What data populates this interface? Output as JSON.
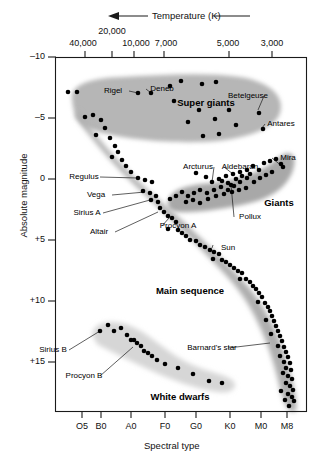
{
  "figure": {
    "kind": "hertzsprung-russell-diagram",
    "top_axis_title": "Temperature (K)",
    "top_axis_arrow": "←",
    "bottom_axis_title": "Spectral type",
    "left_axis_title": "Absolute magnitude"
  },
  "axes": {
    "top_ticks": [
      {
        "label": "40,000",
        "x": 85,
        "label_x": 83,
        "raised": false
      },
      {
        "label": "20,000",
        "x": 112,
        "label_x": 112,
        "raised": true
      },
      {
        "label": "10,000",
        "x": 134,
        "label_x": 136,
        "raised": false
      },
      {
        "label": "7,000",
        "x": 164,
        "label_x": 166,
        "raised": false
      },
      {
        "label": "5,000",
        "x": 229,
        "label_x": 228,
        "raised": false
      },
      {
        "label": "3,000",
        "x": 272,
        "label_x": 272,
        "raised": false
      }
    ],
    "bottom_ticks": [
      {
        "label": "O5",
        "x": 82
      },
      {
        "label": "B0",
        "x": 101
      },
      {
        "label": "A0",
        "x": 131
      },
      {
        "label": "F0",
        "x": 165
      },
      {
        "label": "G0",
        "x": 196
      },
      {
        "label": "K0",
        "x": 230
      },
      {
        "label": "M0",
        "x": 261
      },
      {
        "label": "M8",
        "x": 287
      }
    ],
    "left_ticks": [
      {
        "label": "–10",
        "y": 57
      },
      {
        "label": "–5",
        "y": 118
      },
      {
        "label": "0",
        "y": 179
      },
      {
        "label": "+5",
        "y": 240
      },
      {
        "label": "+10",
        "y": 301
      },
      {
        "label": "+15",
        "y": 362
      }
    ]
  },
  "chart_data": {
    "type": "scatter",
    "xlabel": "Spectral type",
    "ylabel": "Absolute magnitude",
    "secondary_xlabel": "Temperature (K)",
    "xticklabels": [
      "O5",
      "B0",
      "A0",
      "F0",
      "G0",
      "K0",
      "M0",
      "M8"
    ],
    "secondary_xticklabels": [
      "40,000",
      "20,000",
      "10,000",
      "7,000",
      "5,000",
      "3,000"
    ],
    "yticklabels": [
      "–10",
      "–5",
      "0",
      "+5",
      "+10",
      "+15"
    ],
    "ylim": [
      -10,
      17.5
    ],
    "y_inverted": true,
    "grid": false,
    "legend": "none",
    "regions": [
      {
        "name": "Super giants",
        "label_x": 206,
        "label_y": 97,
        "fill": "#b9b9b9"
      },
      {
        "name": "Giants",
        "label_x": 279,
        "label_y": 197,
        "fill": "#ababab"
      },
      {
        "name": "Main sequence",
        "label_x": 190,
        "label_y": 285,
        "fill": "#b0b0b0"
      },
      {
        "name": "White dwarfs",
        "label_x": 180,
        "label_y": 391,
        "fill": "#d8d8d8"
      }
    ],
    "annotations": [
      {
        "name": "Rigel",
        "label_x": 113,
        "label_y": 86,
        "point_x": 138,
        "point_y": 93
      },
      {
        "name": "Deneb",
        "label_x": 162,
        "label_y": 84,
        "point_x": 151,
        "point_y": 93
      },
      {
        "name": "Betelgeuse",
        "label_x": 248,
        "label_y": 91,
        "point_x": 258,
        "point_y": 110
      },
      {
        "name": "Antares",
        "label_x": 281,
        "label_y": 119,
        "point_x": 262,
        "point_y": 128
      },
      {
        "name": "Mira",
        "label_x": 288,
        "label_y": 153,
        "point_x": 283,
        "point_y": 167
      },
      {
        "name": "Arcturus",
        "label_x": 198,
        "label_y": 162,
        "point_x": 212,
        "point_y": 182
      },
      {
        "name": "Aldebaran",
        "label_x": 240,
        "label_y": 162,
        "point_x": 233,
        "point_y": 174
      },
      {
        "name": "Pollux",
        "label_x": 250,
        "label_y": 212,
        "point_x": 231,
        "point_y": 185
      },
      {
        "name": "Regulus",
        "label_x": 84,
        "label_y": 172,
        "point_x": 138,
        "point_y": 178
      },
      {
        "name": "Vega",
        "label_x": 96,
        "label_y": 190,
        "point_x": 145,
        "point_y": 192
      },
      {
        "name": "Sirius A",
        "label_x": 87,
        "label_y": 208,
        "point_x": 150,
        "point_y": 200
      },
      {
        "name": "Altair",
        "label_x": 99,
        "label_y": 227,
        "point_x": 158,
        "point_y": 212
      },
      {
        "name": "Procyon A",
        "label_x": 178,
        "label_y": 221,
        "point_x": 169,
        "point_y": 218
      },
      {
        "name": "Sun",
        "label_x": 228,
        "label_y": 243,
        "point_x": 213,
        "point_y": 245
      },
      {
        "name": "Barnard's star",
        "label_x": 212,
        "label_y": 343,
        "point_x": 270,
        "point_y": 343
      },
      {
        "name": "Sirius B",
        "label_x": 53,
        "label_y": 345,
        "point_x": 100,
        "point_y": 331
      },
      {
        "name": "Procyon B",
        "label_x": 84,
        "label_y": 371,
        "point_x": 133,
        "point_y": 347
      }
    ],
    "points": [
      [
        68,
        92
      ],
      [
        77,
        92
      ],
      [
        138,
        93
      ],
      [
        151,
        93
      ],
      [
        181,
        81
      ],
      [
        202,
        84
      ],
      [
        216,
        82
      ],
      [
        174,
        101
      ],
      [
        199,
        110
      ],
      [
        229,
        110
      ],
      [
        259,
        113
      ],
      [
        188,
        122
      ],
      [
        215,
        119
      ],
      [
        236,
        125
      ],
      [
        263,
        129
      ],
      [
        203,
        136
      ],
      [
        219,
        134
      ],
      [
        170,
        86
      ],
      [
        85,
        117
      ],
      [
        93,
        115
      ],
      [
        101,
        120
      ],
      [
        105,
        128
      ],
      [
        96,
        135
      ],
      [
        110,
        138
      ],
      [
        115,
        146
      ],
      [
        118,
        152
      ],
      [
        112,
        157
      ],
      [
        122,
        160
      ],
      [
        126,
        166
      ],
      [
        131,
        172
      ],
      [
        138,
        178
      ],
      [
        145,
        180
      ],
      [
        152,
        182
      ],
      [
        143,
        191
      ],
      [
        150,
        193
      ],
      [
        156,
        196
      ],
      [
        151,
        200
      ],
      [
        158,
        202
      ],
      [
        160,
        208
      ],
      [
        164,
        212
      ],
      [
        168,
        216
      ],
      [
        172,
        218
      ],
      [
        176,
        222
      ],
      [
        168,
        229
      ],
      [
        178,
        230
      ],
      [
        182,
        233
      ],
      [
        186,
        236
      ],
      [
        190,
        240
      ],
      [
        196,
        241
      ],
      [
        200,
        245
      ],
      [
        205,
        247
      ],
      [
        210,
        250
      ],
      [
        214,
        252
      ],
      [
        219,
        254
      ],
      [
        213,
        259
      ],
      [
        222,
        260
      ],
      [
        226,
        262
      ],
      [
        230,
        265
      ],
      [
        234,
        268
      ],
      [
        238,
        271
      ],
      [
        242,
        273
      ],
      [
        240,
        279
      ],
      [
        246,
        279
      ],
      [
        250,
        282
      ],
      [
        253,
        286
      ],
      [
        256,
        289
      ],
      [
        259,
        293
      ],
      [
        262,
        297
      ],
      [
        258,
        302
      ],
      [
        265,
        303
      ],
      [
        268,
        307
      ],
      [
        270,
        311
      ],
      [
        272,
        316
      ],
      [
        266,
        320
      ],
      [
        274,
        321
      ],
      [
        276,
        326
      ],
      [
        278,
        331
      ],
      [
        271,
        334
      ],
      [
        280,
        336
      ],
      [
        282,
        341
      ],
      [
        278,
        346
      ],
      [
        284,
        347
      ],
      [
        286,
        352
      ],
      [
        280,
        356
      ],
      [
        288,
        357
      ],
      [
        284,
        362
      ],
      [
        290,
        363
      ],
      [
        286,
        368
      ],
      [
        291,
        370
      ],
      [
        283,
        373
      ],
      [
        288,
        376
      ],
      [
        292,
        379
      ],
      [
        286,
        383
      ],
      [
        290,
        386
      ],
      [
        293,
        390
      ],
      [
        288,
        394
      ],
      [
        281,
        391
      ],
      [
        292,
        397
      ],
      [
        285,
        400
      ],
      [
        294,
        401
      ],
      [
        289,
        406
      ],
      [
        196,
        173
      ],
      [
        206,
        177
      ],
      [
        212,
        182
      ],
      [
        219,
        179
      ],
      [
        226,
        176
      ],
      [
        231,
        185
      ],
      [
        233,
        174
      ],
      [
        240,
        172
      ],
      [
        247,
        170
      ],
      [
        253,
        166
      ],
      [
        259,
        170
      ],
      [
        264,
        163
      ],
      [
        270,
        161
      ],
      [
        276,
        159
      ],
      [
        281,
        164
      ],
      [
        283,
        167
      ],
      [
        247,
        178
      ],
      [
        240,
        182
      ],
      [
        234,
        186
      ],
      [
        228,
        190
      ],
      [
        221,
        187
      ],
      [
        214,
        190
      ],
      [
        207,
        193
      ],
      [
        200,
        190
      ],
      [
        194,
        193
      ],
      [
        188,
        196
      ],
      [
        182,
        192
      ],
      [
        176,
        196
      ],
      [
        170,
        199
      ],
      [
        186,
        202
      ],
      [
        193,
        200
      ],
      [
        200,
        203
      ],
      [
        208,
        199
      ],
      [
        216,
        196
      ],
      [
        224,
        194
      ],
      [
        232,
        192
      ],
      [
        239,
        190
      ],
      [
        246,
        188
      ],
      [
        254,
        182
      ],
      [
        260,
        178
      ],
      [
        266,
        175
      ],
      [
        272,
        172
      ],
      [
        222,
        181
      ],
      [
        228,
        183
      ],
      [
        236,
        179
      ],
      [
        242,
        176
      ],
      [
        250,
        174
      ],
      [
        100,
        331
      ],
      [
        108,
        325
      ],
      [
        114,
        331
      ],
      [
        121,
        328
      ],
      [
        127,
        335
      ],
      [
        131,
        340
      ],
      [
        134,
        340
      ],
      [
        137,
        343
      ],
      [
        141,
        346
      ],
      [
        144,
        351
      ],
      [
        148,
        353
      ],
      [
        152,
        356
      ],
      [
        157,
        360
      ],
      [
        165,
        364
      ],
      [
        178,
        368
      ],
      [
        193,
        374
      ],
      [
        209,
        381
      ],
      [
        222,
        383
      ]
    ]
  }
}
